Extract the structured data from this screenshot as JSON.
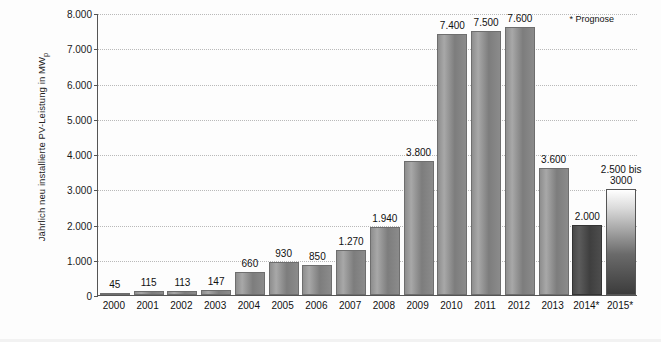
{
  "chart_data": {
    "type": "bar",
    "title": "",
    "xlabel": "",
    "ylabel": "Jährlich neu installierte PV-Leistung in MW",
    "ylabel_subscript": "p",
    "ylim": [
      0,
      8000
    ],
    "ytick_labels": [
      "0",
      "1.000",
      "2.000",
      "3.000",
      "4.000",
      "5.000",
      "6.000",
      "7.000",
      "8.000"
    ],
    "ytick_values": [
      0,
      1000,
      2000,
      3000,
      4000,
      5000,
      6000,
      7000,
      8000
    ],
    "grid": true,
    "legend": "none",
    "categories": [
      "2000",
      "2001",
      "2002",
      "2003",
      "2004",
      "2005",
      "2006",
      "2007",
      "2008",
      "2009",
      "2010",
      "2011",
      "2012",
      "2013",
      "2014*",
      "2015*"
    ],
    "values": [
      45,
      115,
      113,
      147,
      660,
      930,
      850,
      1270,
      1940,
      3800,
      7400,
      7500,
      7600,
      3600,
      2000,
      3000
    ],
    "data_labels": [
      "45",
      "115",
      "113",
      "147",
      "660",
      "930",
      "850",
      "1.270",
      "1.940",
      "3.800",
      "7.400",
      "7.500",
      "7.600",
      "3.600",
      "2.000",
      "2.500 bis\n3000"
    ],
    "bar_styles": [
      "light",
      "light",
      "light",
      "light",
      "light",
      "light",
      "light",
      "light",
      "light",
      "light",
      "light",
      "light",
      "light",
      "light",
      "dark",
      "fade"
    ],
    "footnote": "* Prognose"
  },
  "axis": {
    "y_title_main": "Jährlich neu installierte PV-Leistung in MW",
    "y_title_sub": "p"
  }
}
